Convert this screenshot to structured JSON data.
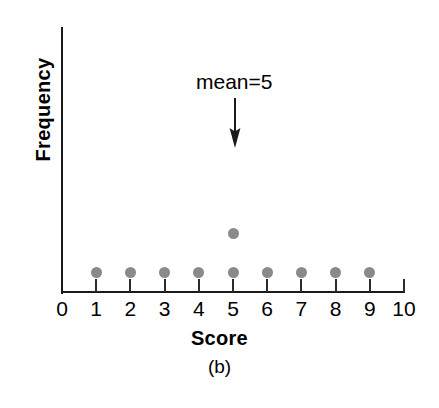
{
  "figure": {
    "panel_label": "(b)",
    "annotation": {
      "text": "mean=5",
      "arrow_icon": "down-arrow-icon"
    }
  },
  "chart_data": {
    "type": "scatter",
    "title": "",
    "subtitle": "",
    "xlabel": "Score",
    "ylabel": "Frequency",
    "xlim": [
      0,
      10
    ],
    "ylim": [
      0,
      4
    ],
    "grid": false,
    "legend": null,
    "x_tick_labels": [
      "0",
      "1",
      "2",
      "3",
      "4",
      "5",
      "6",
      "7",
      "8",
      "9",
      "10"
    ],
    "y_tick_labels": [],
    "series": [
      {
        "name": "Frequency of scores",
        "marker": "filled-circle",
        "color": "#8a8a8a",
        "points": [
          {
            "x": 1,
            "y": 1
          },
          {
            "x": 2,
            "y": 1
          },
          {
            "x": 3,
            "y": 1
          },
          {
            "x": 4,
            "y": 1
          },
          {
            "x": 5,
            "y": 1
          },
          {
            "x": 5,
            "y": 2
          },
          {
            "x": 6,
            "y": 1
          },
          {
            "x": 7,
            "y": 1
          },
          {
            "x": 8,
            "y": 1
          },
          {
            "x": 9,
            "y": 1
          }
        ]
      }
    ],
    "categories": [
      1,
      2,
      3,
      4,
      5,
      6,
      7,
      8,
      9,
      10
    ],
    "values": [
      1,
      1,
      1,
      1,
      2,
      1,
      1,
      1,
      1,
      0
    ],
    "annotations": [
      {
        "text": "mean=5",
        "points_to_x": 5,
        "style": "down-arrow"
      }
    ],
    "axis_color": "#1a1a1a",
    "marker_color": "#8a8a8a"
  }
}
